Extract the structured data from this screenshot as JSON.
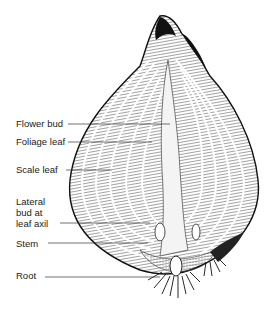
{
  "diagram": {
    "labels": [
      {
        "text": "Flower bud",
        "x": 16,
        "y": 118,
        "line_y": 124,
        "line_x1": 68,
        "line_x2": 170
      },
      {
        "text": "Foliage leaf",
        "x": 16,
        "y": 136,
        "line_y": 142,
        "line_x1": 68,
        "line_x2": 152
      },
      {
        "text": "Scale leaf",
        "x": 16,
        "y": 163,
        "line_y": 170,
        "line_x1": 66,
        "line_x2": 112
      },
      {
        "text": "Lateral\nbud at\nleaf axil",
        "x": 16,
        "y": 197,
        "line_y": 223,
        "line_x1": 60,
        "line_x2": 150
      },
      {
        "text": "Stem",
        "x": 16,
        "y": 238,
        "line_y": 243,
        "line_x1": 48,
        "line_x2": 148
      },
      {
        "text": "Root",
        "x": 16,
        "y": 269,
        "line_y": 277,
        "line_x1": 45,
        "line_x2": 160
      }
    ],
    "colors": {
      "ink": "#1a1a1a",
      "background": "#ffffff"
    }
  }
}
